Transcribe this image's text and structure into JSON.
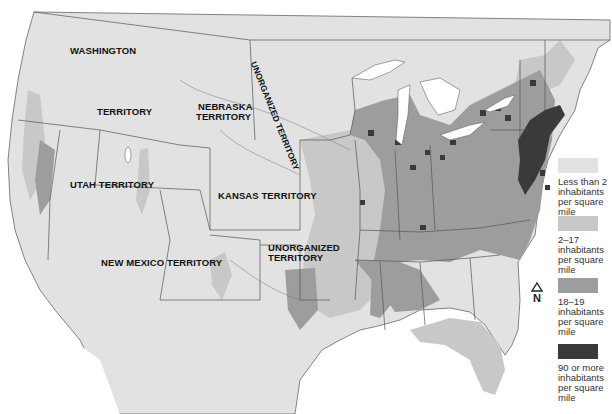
{
  "map": {
    "title": "Population density of the United States, c. 1854",
    "colors": {
      "water": "#ffffff",
      "land_lt2": "#e2e2e2",
      "land_2_17": "#c8c8c8",
      "land_18_19": "#9d9d9d",
      "land_90plus": "#3a3a3a",
      "border": "#555555",
      "label": "#111111"
    },
    "labels": {
      "washington": "WASHINGTON",
      "territory": "TERRITORY",
      "nebraska_1": "NEBRASKA",
      "nebraska_2": "TERRITORY",
      "unorganized_north": "UNORGANIZED TERRITORY",
      "utah": "UTAH TERRITORY",
      "kansas": "KANSAS TERRITORY",
      "new_mexico": "NEW MEXICO TERRITORY",
      "unorganized_south_1": "UNORGANIZED",
      "unorganized_south_2": "TERRITORY"
    },
    "compass": {
      "icon": "north-arrow-icon",
      "label": "N"
    },
    "legend": {
      "items": [
        {
          "label": "Less than 2 inhabitants per square mile",
          "color": "#e2e2e2"
        },
        {
          "label": "2–17 inhabitants per square mile",
          "color": "#c8c8c8"
        },
        {
          "label": "18–19 inhabitants per square mile",
          "color": "#9d9d9d"
        },
        {
          "label": "90 or more inhabitants per square mile",
          "color": "#3a3a3a"
        }
      ]
    }
  }
}
